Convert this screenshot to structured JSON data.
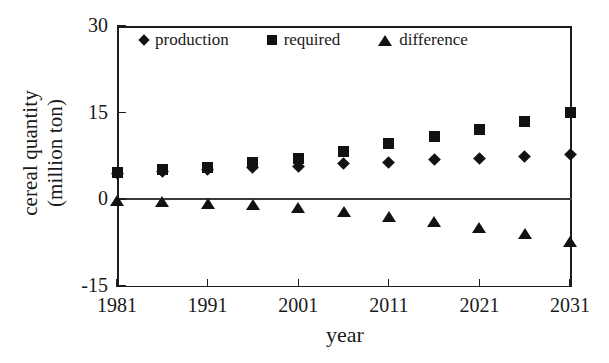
{
  "chart_data": {
    "type": "scatter",
    "title": "",
    "xlabel": "year",
    "ylabel": "cereal quantity (million ton)",
    "ylabel_line1": "cereal quantity",
    "ylabel_line2": "(million ton)",
    "x": [
      1981,
      1986,
      1991,
      1996,
      2001,
      2006,
      2011,
      2016,
      2021,
      2026,
      2031
    ],
    "xlim": [
      1981,
      2031
    ],
    "ylim": [
      -15,
      30
    ],
    "xticks": [
      1981,
      1991,
      2001,
      2011,
      2021,
      2031
    ],
    "xtick_labels": [
      "1981",
      "1991",
      "2001",
      "2011",
      "2021",
      "2031"
    ],
    "yticks": [
      -15,
      0,
      15,
      30
    ],
    "ytick_labels": [
      "-15",
      "0",
      "15",
      "30"
    ],
    "grid": false,
    "zero_line": true,
    "legend_position": "top-inside",
    "series": [
      {
        "name": "production",
        "marker": "diamond",
        "color": "#121212",
        "values": [
          4.4,
          4.8,
          5.2,
          5.4,
          5.7,
          6.1,
          6.4,
          6.8,
          7.1,
          7.4,
          7.7
        ]
      },
      {
        "name": "required",
        "marker": "square",
        "color": "#121212",
        "values": [
          4.6,
          5.1,
          5.5,
          6.3,
          7.1,
          8.2,
          9.7,
          10.8,
          12.0,
          13.5,
          15.0
        ]
      },
      {
        "name": "difference",
        "marker": "triangle",
        "color": "#121212",
        "values": [
          -0.3,
          -0.6,
          -0.8,
          -1.1,
          -1.6,
          -2.3,
          -3.1,
          -4.0,
          -5.0,
          -6.0,
          -7.5
        ]
      }
    ]
  },
  "legend": {
    "items": [
      {
        "label": "production",
        "marker": "diamond"
      },
      {
        "label": "required",
        "marker": "square"
      },
      {
        "label": "difference",
        "marker": "triangle"
      }
    ]
  }
}
